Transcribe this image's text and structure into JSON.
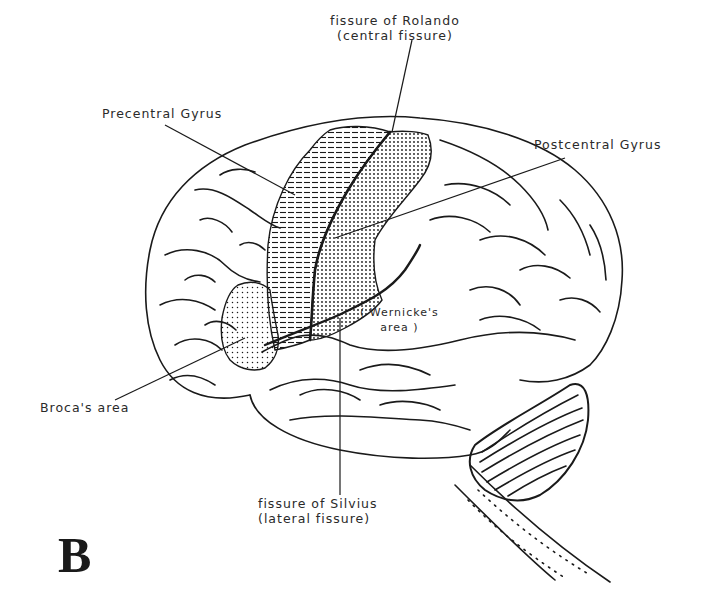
{
  "figure": {
    "panel_letter": "B",
    "colors": {
      "ink": "#1a1a1a",
      "label_text": "#2a2a2a",
      "background": "#ffffff"
    },
    "labels": {
      "rolando_line1": "fissure of Rolando",
      "rolando_line2": "(central fissure)",
      "precentral": "Precentral Gyrus",
      "postcentral": "Postcentral Gyrus",
      "wernicke_line1": "( Wernicke's",
      "wernicke_line2": "area )",
      "broca": "Broca's area",
      "silvius_line1": "fissure of Silvius",
      "silvius_line2": "(lateral fissure)"
    },
    "regions": [
      {
        "name": "Precentral Gyrus",
        "fill": "horizontal-hatch"
      },
      {
        "name": "Postcentral Gyrus",
        "fill": "dense-dots"
      },
      {
        "name": "Broca's area",
        "fill": "sparse-dots"
      }
    ]
  }
}
